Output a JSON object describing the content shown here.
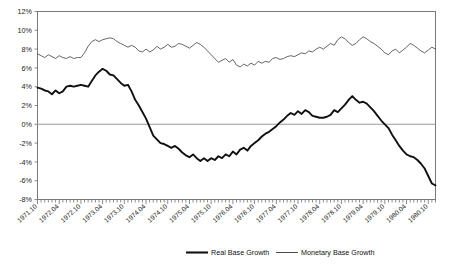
{
  "chart_data": {
    "type": "line",
    "title": "",
    "subtitle": "",
    "xlabel": "",
    "ylabel": "",
    "ylim": [
      -8,
      12
    ],
    "ytick_labels": [
      "12%",
      "10%",
      "8%",
      "6%",
      "4%",
      "2%",
      "0%",
      "-2%",
      "-4%",
      "-6%",
      "-8%"
    ],
    "ytick_values": [
      12,
      10,
      8,
      6,
      4,
      2,
      0,
      -2,
      -4,
      -6,
      -8
    ],
    "grid": false,
    "zero_line": true,
    "legend_position": "bottom",
    "xtick_labels": [
      "1971.10",
      "1972.04",
      "1972.10",
      "1973.04",
      "1973.10",
      "1974.04",
      "1974.10",
      "1975.04",
      "1975.10",
      "1976.04",
      "1976.10",
      "1977.04",
      "1977.10",
      "1978.04",
      "1978.10",
      "1979.04",
      "1979.10",
      "1980.04",
      "1980.10"
    ],
    "x_start": "1971.10",
    "x_end": "1980.12",
    "x_interval_months": 1,
    "x": [
      "1971.10",
      "1971.11",
      "1971.12",
      "1972.01",
      "1972.02",
      "1972.03",
      "1972.04",
      "1972.05",
      "1972.06",
      "1972.07",
      "1972.08",
      "1972.09",
      "1972.10",
      "1972.11",
      "1972.12",
      "1973.01",
      "1973.02",
      "1973.03",
      "1973.04",
      "1973.05",
      "1973.06",
      "1973.07",
      "1973.08",
      "1973.09",
      "1973.10",
      "1973.11",
      "1973.12",
      "1974.01",
      "1974.02",
      "1974.03",
      "1974.04",
      "1974.05",
      "1974.06",
      "1974.07",
      "1974.08",
      "1974.09",
      "1974.10",
      "1974.11",
      "1974.12",
      "1975.01",
      "1975.02",
      "1975.03",
      "1975.04",
      "1975.05",
      "1975.06",
      "1975.07",
      "1975.08",
      "1975.09",
      "1975.10",
      "1975.11",
      "1975.12",
      "1976.01",
      "1976.02",
      "1976.03",
      "1976.04",
      "1976.05",
      "1976.06",
      "1976.07",
      "1976.08",
      "1976.09",
      "1976.10",
      "1976.11",
      "1976.12",
      "1977.01",
      "1977.02",
      "1977.03",
      "1977.04",
      "1977.05",
      "1977.06",
      "1977.07",
      "1977.08",
      "1977.09",
      "1977.10",
      "1977.11",
      "1977.12",
      "1978.01",
      "1978.02",
      "1978.03",
      "1978.04",
      "1978.05",
      "1978.06",
      "1978.07",
      "1978.08",
      "1978.09",
      "1978.10",
      "1978.11",
      "1978.12",
      "1979.01",
      "1979.02",
      "1979.03",
      "1979.04",
      "1979.05",
      "1979.06",
      "1979.07",
      "1979.08",
      "1979.09",
      "1979.10",
      "1979.11",
      "1979.12",
      "1980.01",
      "1980.02",
      "1980.03",
      "1980.04",
      "1980.05",
      "1980.06",
      "1980.07",
      "1980.08",
      "1980.09",
      "1980.10",
      "1980.11",
      "1980.12"
    ],
    "series": [
      {
        "name": "Real Base Growth",
        "style": "thick",
        "color": "#111111",
        "values": [
          3.9,
          3.8,
          3.6,
          3.5,
          3.2,
          3.6,
          3.3,
          3.5,
          4.0,
          4.1,
          4.0,
          4.1,
          4.2,
          4.1,
          4.0,
          4.6,
          5.2,
          5.6,
          5.9,
          5.7,
          5.3,
          5.2,
          4.8,
          4.4,
          4.1,
          4.2,
          3.5,
          2.6,
          2.0,
          1.3,
          0.6,
          -0.3,
          -1.2,
          -1.6,
          -2.0,
          -2.1,
          -2.3,
          -2.5,
          -2.3,
          -2.6,
          -3.0,
          -3.3,
          -3.5,
          -3.2,
          -3.6,
          -3.9,
          -3.6,
          -3.9,
          -3.6,
          -3.8,
          -3.4,
          -3.6,
          -3.2,
          -3.4,
          -2.9,
          -3.2,
          -2.7,
          -2.5,
          -2.8,
          -2.3,
          -2.0,
          -1.7,
          -1.3,
          -1.0,
          -0.8,
          -0.5,
          -0.2,
          0.2,
          0.5,
          0.9,
          1.2,
          1.0,
          1.4,
          1.1,
          1.5,
          1.3,
          0.9,
          0.8,
          0.7,
          0.7,
          0.8,
          1.0,
          1.5,
          1.3,
          1.7,
          2.1,
          2.6,
          3.0,
          2.6,
          2.3,
          2.4,
          2.2,
          1.8,
          1.4,
          0.9,
          0.4,
          0.0,
          -0.4,
          -1.1,
          -1.7,
          -2.3,
          -2.8,
          -3.2,
          -3.4,
          -3.5,
          -3.8,
          -4.2,
          -4.7,
          -5.5,
          -6.3,
          -6.5
        ]
      },
      {
        "name": "Monetary Base Growth",
        "style": "thin",
        "color": "#4a4a4a",
        "values": [
          7.5,
          7.3,
          7.1,
          7.4,
          7.2,
          7.0,
          7.3,
          7.1,
          7.0,
          7.2,
          7.0,
          7.1,
          7.1,
          7.6,
          8.3,
          8.8,
          9.0,
          8.8,
          9.0,
          9.1,
          9.2,
          9.1,
          8.8,
          8.6,
          8.4,
          8.2,
          8.4,
          8.2,
          7.8,
          7.7,
          8.0,
          7.7,
          7.9,
          8.3,
          8.0,
          8.2,
          8.5,
          8.2,
          8.3,
          8.6,
          8.5,
          8.3,
          8.1,
          8.4,
          8.7,
          8.5,
          8.2,
          7.8,
          7.4,
          7.0,
          6.6,
          6.8,
          7.0,
          6.6,
          6.9,
          6.3,
          6.1,
          6.4,
          6.2,
          6.5,
          6.3,
          6.7,
          6.5,
          6.7,
          6.6,
          7.0,
          7.1,
          6.9,
          7.0,
          7.2,
          7.3,
          7.2,
          7.4,
          7.6,
          7.5,
          7.8,
          7.7,
          8.0,
          8.2,
          8.0,
          8.3,
          8.6,
          8.4,
          9.0,
          9.3,
          9.1,
          8.7,
          8.4,
          8.6,
          9.0,
          9.3,
          9.1,
          8.8,
          8.6,
          8.3,
          8.0,
          7.6,
          7.4,
          7.8,
          8.0,
          7.6,
          7.9,
          8.2,
          8.6,
          8.4,
          8.1,
          7.8,
          7.6,
          7.9,
          8.2,
          8.0
        ]
      }
    ],
    "legend": [
      {
        "label": "Real Base Growth",
        "style": "thick"
      },
      {
        "label": "Monetary Base Growth",
        "style": "thin"
      }
    ]
  }
}
